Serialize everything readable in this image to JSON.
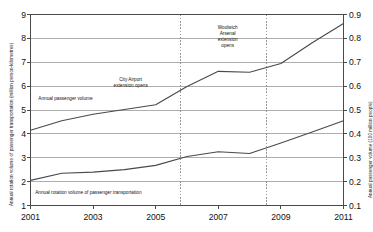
{
  "chart_data": {
    "type": "line",
    "title": "",
    "xlabel": "",
    "ylabel": "Annual rotation volume of passenger transportation (million person-kilometres)",
    "ylabel_right": "Annual passenger volume (100 million people)",
    "x": [
      2001,
      2002,
      2003,
      2004,
      2005,
      2006,
      2007,
      2008,
      2009,
      2010,
      2011
    ],
    "xlim": [
      2001,
      2011
    ],
    "xticks": [
      2001,
      2003,
      2005,
      2007,
      2009,
      2011
    ],
    "xtick_labels": [
      "2001",
      "2003",
      "2005",
      "2007",
      "2009",
      "2011"
    ],
    "ylim_left": [
      1,
      9
    ],
    "yticks_left": [
      1,
      2,
      3,
      4,
      5,
      6,
      7,
      8,
      9
    ],
    "ytick_labels_left": [
      "1",
      "2",
      "3",
      "4",
      "5",
      "6",
      "7",
      "8",
      "9"
    ],
    "ylim_right": [
      0.1,
      0.9
    ],
    "yticks_right": [
      0.1,
      0.2,
      0.3,
      0.4,
      0.5,
      0.6,
      0.7,
      0.8,
      0.9
    ],
    "ytick_labels_right": [
      "0.1",
      "0.2",
      "0.3",
      "0.4",
      "0.5",
      "0.6",
      "0.7",
      "0.8",
      "0.9"
    ],
    "grid": true,
    "legend_position": "inline-labels",
    "line_color": "#4a4a4a",
    "grid_color": "#9a9a9a",
    "axis_color": "#4a4a4a",
    "marker_color": "#8c8c8c",
    "series": [
      {
        "name": "Annual passenger volume",
        "axis": "right",
        "values": [
          0.415,
          0.455,
          0.482,
          0.502,
          0.522,
          0.598,
          0.662,
          0.658,
          0.695,
          0.782,
          0.862
        ]
      },
      {
        "name": "Annual rotation volume of passenger transportation",
        "axis": "right",
        "values": [
          0.205,
          0.235,
          0.24,
          0.25,
          0.268,
          0.305,
          0.325,
          0.318,
          0.362,
          0.408,
          0.455
        ]
      }
    ],
    "annotations": [
      {
        "id": "city-airport",
        "lines": [
          "City Airport",
          "extension opens"
        ],
        "x": 2005.8,
        "label_x": 2004.2,
        "label_y_right": 0.625
      },
      {
        "id": "woolwich-arsenal",
        "lines": [
          "Woolwich",
          "Arsenal",
          "extension",
          "opens"
        ],
        "x": 2008.55,
        "label_x": 2007.3,
        "label_y_right": 0.845
      }
    ],
    "event_markers": [
      {
        "id": "city-airport-marker",
        "x": 2005.8,
        "style": "dashed"
      },
      {
        "id": "woolwich-arsenal-marker",
        "x": 2008.55,
        "style": "dashed"
      }
    ],
    "series_labels": [
      {
        "id": "upper-series-label",
        "text": "Annual passenger volume",
        "x": 2001.25,
        "y_right": 0.545
      },
      {
        "id": "lower-series-label",
        "text": "Annual rotation volume of passenger transportation",
        "x": 2001.15,
        "y_right": 0.152
      }
    ]
  }
}
